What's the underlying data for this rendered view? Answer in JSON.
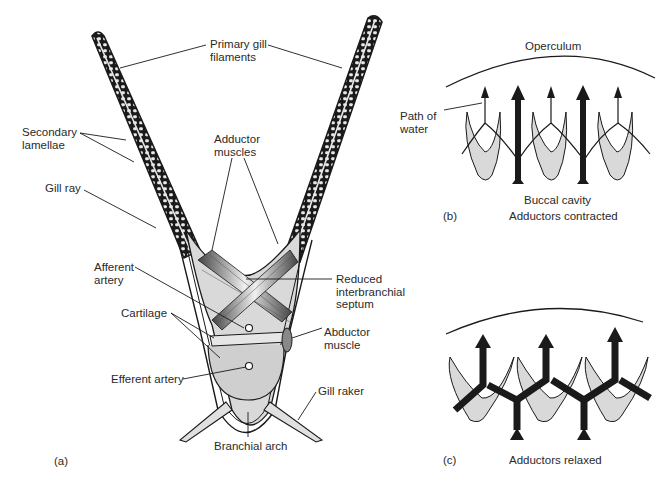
{
  "panel_a": {
    "caption": "(a)",
    "labels": {
      "primary_gill_filaments": "Primary gill\nfilaments",
      "secondary_lamellae": "Secondary\nlamellae",
      "gill_ray": "Gill ray",
      "adductor_muscles": "Adductor\nmuscles",
      "afferent_artery": "Afferent\nartery",
      "reduced_interbranchial_septum": "Reduced\ninterbranchial\nseptum",
      "cartilage": "Cartilage",
      "abductor_muscle": "Abductor\nmuscle",
      "efferent_artery": "Efferent artery",
      "gill_raker": "Gill raker",
      "branchial_arch": "Branchial arch"
    }
  },
  "panel_b": {
    "caption": "(b)",
    "title": "Adductors contracted",
    "labels": {
      "operculum": "Operculum",
      "path_of_water": "Path of\nwater",
      "buccal_cavity": "Buccal cavity"
    }
  },
  "panel_c": {
    "caption": "(c)",
    "title": "Adductors relaxed"
  },
  "colors": {
    "ink": "#1a1a1a",
    "fill": "#d9d9d9",
    "background": "#ffffff"
  }
}
